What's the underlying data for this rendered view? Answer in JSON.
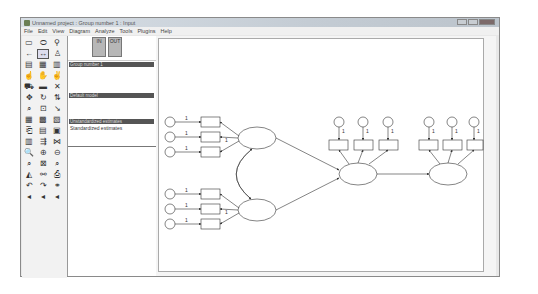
{
  "window": {
    "title": "Unnamed project : Group number 1 : Input",
    "controls": [
      "minimize",
      "maximize",
      "close"
    ]
  },
  "menubar": {
    "items": [
      "File",
      "Edit",
      "View",
      "Diagram",
      "Analyze",
      "Tools",
      "Plugins",
      "Help"
    ]
  },
  "toolbox": {
    "tools": [
      {
        "name": "draw-observed-variable-icon",
        "glyph": "▭"
      },
      {
        "name": "draw-unobserved-variable-icon",
        "glyph": "⬭"
      },
      {
        "name": "draw-latent-indicator-icon",
        "glyph": "⚲"
      },
      {
        "name": "draw-path-icon",
        "glyph": "←"
      },
      {
        "name": "draw-covariance-icon",
        "glyph": "↔"
      },
      {
        "name": "add-unique-variable-icon",
        "glyph": "♙"
      },
      {
        "name": "list-variables-in-model-icon",
        "glyph": "▤"
      },
      {
        "name": "list-variables-in-dataset-icon",
        "glyph": "▦"
      },
      {
        "name": "select-one-object-icon",
        "glyph": "▥"
      },
      {
        "name": "select-all-icon",
        "glyph": "☝"
      },
      {
        "name": "deselect-all-icon",
        "glyph": "✋"
      },
      {
        "name": "duplicate-icon",
        "glyph": "✌"
      },
      {
        "name": "move-icon",
        "glyph": "⛟"
      },
      {
        "name": "erase-icon",
        "glyph": "▬"
      },
      {
        "name": "delete-icon",
        "glyph": "✕"
      },
      {
        "name": "change-shape-icon",
        "glyph": "✥"
      },
      {
        "name": "rotate-indicators-icon",
        "glyph": "↻"
      },
      {
        "name": "reflect-indicators-icon",
        "glyph": "⇅"
      },
      {
        "name": "move-parameters-icon",
        "glyph": "⌕"
      },
      {
        "name": "scroll-icon",
        "glyph": "⊡"
      },
      {
        "name": "touch-up-icon",
        "glyph": "↘"
      },
      {
        "name": "select-data-file-icon",
        "glyph": "▦"
      },
      {
        "name": "analysis-properties-icon",
        "glyph": "▩"
      },
      {
        "name": "calculate-estimates-icon",
        "glyph": "▧"
      },
      {
        "name": "copy-to-clipboard-icon",
        "glyph": "⎗"
      },
      {
        "name": "view-text-output-icon",
        "glyph": "▤"
      },
      {
        "name": "save-diagram-icon",
        "glyph": "▣"
      },
      {
        "name": "object-properties-icon",
        "glyph": "▥"
      },
      {
        "name": "drag-properties-icon",
        "glyph": "⇶"
      },
      {
        "name": "preserve-symmetries-icon",
        "glyph": "⋈"
      },
      {
        "name": "zoom-in-area-icon",
        "glyph": "🔍"
      },
      {
        "name": "zoom-in-icon",
        "glyph": "⊕"
      },
      {
        "name": "zoom-out-icon",
        "glyph": "⊖"
      },
      {
        "name": "zoom-page-icon",
        "glyph": "⌕"
      },
      {
        "name": "fit-to-page-icon",
        "glyph": "⊠"
      },
      {
        "name": "loupe-icon",
        "glyph": "⌕"
      },
      {
        "name": "bayesian-estimation-icon",
        "glyph": "◭"
      },
      {
        "name": "multiple-group-analysis-icon",
        "glyph": "⚯"
      },
      {
        "name": "print-icon",
        "glyph": "⎙"
      },
      {
        "name": "undo-icon",
        "glyph": "↶"
      },
      {
        "name": "redo-icon",
        "glyph": "↷"
      },
      {
        "name": "specification-search-icon",
        "glyph": "⚭"
      },
      {
        "name": "arrow-left-1-icon",
        "glyph": "◂"
      },
      {
        "name": "arrow-left-2-icon",
        "glyph": "◂"
      },
      {
        "name": "arrow-left-3-icon",
        "glyph": "◂"
      }
    ]
  },
  "panel": {
    "views": [
      {
        "name": "view-input-button",
        "label": "IN"
      },
      {
        "name": "view-output-button",
        "label": "OUT"
      }
    ],
    "groups_header": "Group number 1",
    "models_header": "Default model",
    "estimates_header": "Unstandardized estimates",
    "estimates_items": [
      "Standardized estimates"
    ]
  },
  "diagram": {
    "path_labels": [
      "1",
      "1",
      "1",
      "1",
      "1",
      "1",
      "1",
      "1"
    ],
    "error_labels": [
      "1",
      "1",
      "1",
      "1",
      "1",
      "1"
    ],
    "colors": {
      "stroke": "#333333",
      "background": "#ffffff"
    }
  }
}
